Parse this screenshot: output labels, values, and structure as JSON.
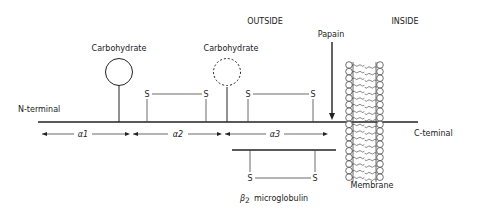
{
  "diagram": {
    "type": "molecular-structure",
    "regions": {
      "outside_label": "OUTSIDE",
      "inside_label": "INSIDE"
    },
    "chain": {
      "n_terminal_label": "N-terminal",
      "c_terminal_label": "C-teminal"
    },
    "domains": [
      {
        "label": "α1"
      },
      {
        "label": "α2"
      },
      {
        "label": "α3"
      }
    ],
    "carbohydrates": [
      {
        "label": "Carbohydrate",
        "style": "solid"
      },
      {
        "label": "Carbohydrate",
        "style": "dashed"
      }
    ],
    "disulfide_bonds": [
      {
        "left": "S",
        "right": "S"
      },
      {
        "left": "S",
        "right": "S"
      },
      {
        "left": "S",
        "right": "S"
      }
    ],
    "papain_label": "Papain",
    "membrane_label": "Membrane",
    "beta2": {
      "label_symbol": "β",
      "label_sub": "2",
      "label_rest": "microglobulin"
    }
  }
}
